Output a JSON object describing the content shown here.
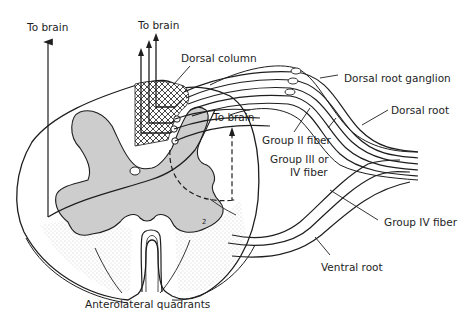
{
  "diagram": {
    "type": "anatomical cross-section",
    "labels": {
      "to_brain_left": "To brain",
      "to_brain_top": "To brain",
      "to_brain_right": "To brain",
      "dorsal_column": "Dorsal column",
      "dorsal_root_ganglion": "Dorsal root ganglion",
      "dorsal_root": "Dorsal root",
      "group_ii_fiber": "Group II fiber",
      "group_iii_iv_line1": "Group III or",
      "group_iii_iv_line2": "IV fiber",
      "group_iv_fiber": "Group IV fiber",
      "ventral_root": "Ventral root",
      "anterolateral_quadrants": "Anterolateral quadrants",
      "marker_2": "2"
    },
    "colors": {
      "line": "#1e1e1e",
      "gray_matter": "#cfcfcf",
      "stipple": "#9a9a9a",
      "background": "#ffffff"
    }
  }
}
